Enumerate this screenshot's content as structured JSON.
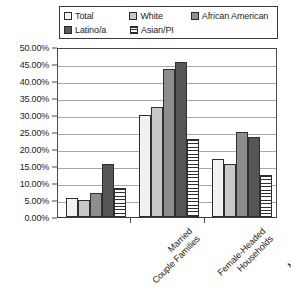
{
  "chart_data": {
    "type": "bar",
    "title": "",
    "subtitle": "",
    "xlabel": "",
    "ylabel": "",
    "ylim": [
      0,
      50
    ],
    "grid": true,
    "legend_position": "top",
    "value_suffix": "%",
    "categories": [
      "Married Couple Families",
      "Female-Headed Households",
      "Male-Headed Households"
    ],
    "category_lines": [
      [
        "Married",
        "Couple Families"
      ],
      [
        "Female-Headed",
        "Households"
      ],
      [
        "Male-Headed",
        "Households"
      ]
    ],
    "ytick_labels": [
      "50.00%",
      "45.00%",
      "40.00%",
      "35.00%",
      "30.00%",
      "25.00%",
      "20.00%",
      "15.00%",
      "10.00%",
      "5.00%",
      "0.00%"
    ],
    "ytick_values": [
      50,
      45,
      40,
      35,
      30,
      25,
      20,
      15,
      10,
      5,
      0
    ],
    "series": [
      {
        "name": "Total",
        "key": "total",
        "fill": "#f2f2f2",
        "pattern": "solid",
        "values": [
          5.5,
          30.0,
          17.0
        ]
      },
      {
        "name": "White",
        "key": "white",
        "fill": "#c8c8c8",
        "pattern": "solid",
        "values": [
          5.0,
          32.5,
          15.5
        ]
      },
      {
        "name": "African American",
        "key": "aa",
        "fill": "#8d8d8d",
        "pattern": "solid",
        "values": [
          7.0,
          43.5,
          25.0
        ]
      },
      {
        "name": "Latino/a",
        "key": "latino",
        "fill": "#555555",
        "pattern": "solid",
        "values": [
          15.5,
          45.5,
          23.5
        ]
      },
      {
        "name": "Asian/PI",
        "key": "asian",
        "fill": "#ffffff",
        "pattern": "horizontal-lines",
        "values": [
          8.5,
          23.0,
          12.5
        ]
      }
    ]
  },
  "legend": {
    "entries": [
      {
        "label": "Total"
      },
      {
        "label": "White"
      },
      {
        "label": "African American"
      },
      {
        "label": "Latino/a"
      },
      {
        "label": "Asian/PI"
      }
    ]
  }
}
